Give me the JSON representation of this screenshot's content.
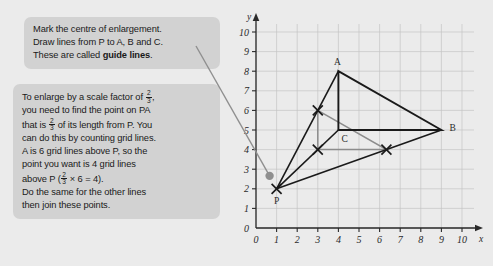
{
  "page": {
    "background": "#ebebeb",
    "callout_bg": "#d2d2d2"
  },
  "callouts": [
    {
      "id": "callout-1",
      "lines": [
        "Mark the centre of enlargement.",
        "Draw lines from P to A, B and C.",
        "These are called "
      ],
      "bold_tail": "guide lines",
      "tail_period": "."
    },
    {
      "id": "callout-2",
      "line1_a": "To enlarge by a scale factor of ",
      "frac1": {
        "num": "2",
        "den": "3"
      },
      "line1_b": ",",
      "line2": "you need to find the point on PA",
      "line3_a": "that is ",
      "frac2": {
        "num": "2",
        "den": "3"
      },
      "line3_b": " of its length from P. You",
      "line4": "can do this by counting grid lines.",
      "line5": "A is 6 grid lines above P, so the",
      "line6": "point you want is 4 grid lines",
      "line7_a": "above P (",
      "frac3": {
        "num": "2",
        "den": "3"
      },
      "line7_b": " × 6 = 4).",
      "line8": "Do the same for the other lines",
      "line9": "then join these points."
    }
  ],
  "chart_data": {
    "type": "diagram",
    "title": "",
    "xlabel": "x",
    "ylabel": "y",
    "xlim": [
      0,
      10
    ],
    "ylim": [
      0,
      10
    ],
    "grid": true,
    "x_ticks": [
      "0",
      "1",
      "2",
      "3",
      "4",
      "5",
      "6",
      "7",
      "8",
      "9",
      "10"
    ],
    "y_ticks": [
      "0",
      "1",
      "2",
      "3",
      "4",
      "5",
      "6",
      "7",
      "8",
      "9",
      "10"
    ],
    "points": [
      {
        "name": "P",
        "label": "P",
        "x": 1,
        "y": 2,
        "marker": "cross",
        "color": "#1a1a1a"
      },
      {
        "name": "A",
        "label": "A",
        "x": 4,
        "y": 8,
        "marker": "none",
        "color": "#1a1a1a"
      },
      {
        "name": "B",
        "label": "B",
        "x": 9,
        "y": 5,
        "marker": "none",
        "color": "#1a1a1a"
      },
      {
        "name": "C",
        "label": "C",
        "x": 4,
        "y": 5,
        "marker": "none",
        "color": "#1a1a1a"
      },
      {
        "name": "A-image",
        "label": "",
        "x": 3,
        "y": 6,
        "marker": "cross",
        "color": "#1a1a1a"
      },
      {
        "name": "C-image",
        "label": "",
        "x": 3,
        "y": 4,
        "marker": "cross",
        "color": "#1a1a1a"
      },
      {
        "name": "B-image",
        "label": "",
        "x": 6.33,
        "y": 4,
        "marker": "cross",
        "color": "#1a1a1a"
      }
    ],
    "original_triangle": {
      "name": "ABC",
      "vertices": [
        [
          4,
          8
        ],
        [
          9,
          5
        ],
        [
          4,
          5
        ]
      ],
      "color": "#1a1a1a"
    },
    "image_triangle": {
      "name": "A'B'C'",
      "vertices": [
        [
          3,
          6
        ],
        [
          6.33,
          4
        ],
        [
          3,
          4
        ]
      ],
      "color": "#8c8c8c"
    },
    "guide_lines": [
      {
        "from": [
          1,
          2
        ],
        "to": [
          4,
          8
        ],
        "color": "#1a1a1a"
      },
      {
        "from": [
          1,
          2
        ],
        "to": [
          9,
          5
        ],
        "color": "#1a1a1a"
      },
      {
        "from": [
          1,
          2
        ],
        "to": [
          4,
          5
        ],
        "color": "#1a1a1a"
      }
    ],
    "centre_marker": {
      "name": "centre-of-enlargement-dot",
      "x": 0.66,
      "y": 2.66,
      "color": "#8f8f8f"
    },
    "leader_line": {
      "from_px": [
        196,
        46
      ],
      "to": [
        0.66,
        2.66
      ],
      "color": "#8f8f8f"
    }
  }
}
